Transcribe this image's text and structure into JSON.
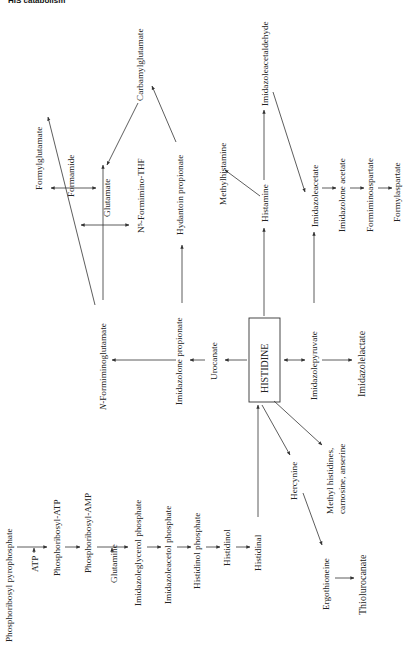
{
  "header": {
    "text": "HIS catabolism"
  },
  "diagram": {
    "center": "HISTIDINE",
    "biosynthesis": [
      "Phosphoribosyl pyrophosphate",
      "ATP",
      "Phosphoribosyl-ATP",
      "Phosphoribosyl-AMP",
      "Glutamine",
      "Imidazoleglycerol phosphate",
      "Imidazoleacetol phosphate",
      "Histidinol phosphate",
      "Histidinol",
      "Histidinal"
    ],
    "urocanate_path": [
      "Urocanate",
      "Imidazolone propionate",
      "N-Formiminoglutamate",
      "Formylglutamate",
      "Formamide",
      "Glutamate",
      "N5-Formimino-THF",
      "Hydantoin propionate",
      "Carbamylglutamate"
    ],
    "histamine_path": [
      "Histamine",
      "Methylhistamine",
      "Imidazoleacetaldehyde",
      "Imidazoleacetate",
      "Imidazolone acetate",
      "Formiminoaspartate",
      "Formylaspartate"
    ],
    "transamination_path": [
      "Imidazolepyruvate",
      "Imidazolelactate"
    ],
    "other_products": [
      "Hercynine",
      "Methyl histidines, carnosine, anserine",
      "Ergothioneine",
      "Thiolurocanate"
    ]
  },
  "labels": {
    "prpp": "Phosphoribosyl pyrophosphate",
    "atp": "ATP",
    "pr_atp": "Phosphoribosyl-ATP",
    "pr_amp": "Phosphoribosyl-AMP",
    "glutamine": "Glutamine",
    "igp": "Imidazoleglycerol phosphate",
    "iap": "Imidazoleacetol phosphate",
    "hp": "Histidinol phosphate",
    "histidinol": "Histidinol",
    "histidinal": "Histidinal",
    "histidine": "HISTIDINE",
    "urocanate": "Urocanate",
    "imidazolone_prop": "Imidazolone propionate",
    "nfig": "-Formiminoglutamate",
    "nfig_n": "N",
    "formylglutamate": "Formylglutamate",
    "formamide": "Formamide",
    "glutamate": "Glutamate",
    "n5_thf": "N⁵-Formimino-THF",
    "hydantoin": "Hydantoin propionate",
    "carbamyl": "Carbamylglutamate",
    "histamine": "Histamine",
    "methylhistamine": "Methylhistamine",
    "iaald": "Imidazoleacetaldehyde",
    "iaa": "Imidazoleacetate",
    "ia_acetate": "Imidazolone acetate",
    "fasp": "Formiminoaspartate",
    "formylasp": "Formylaspartate",
    "ipyr": "Imidazolepyruvate",
    "ilac": "Imidazolelactate",
    "hercynine": "Hercynine",
    "methylhis_1": "Methyl histidines,",
    "methylhis_2": "carnosine, anserine",
    "ergo": "Ergothioneine",
    "thiol": "Thiolurocanate"
  }
}
